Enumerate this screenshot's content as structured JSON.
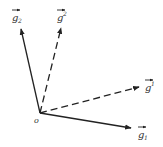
{
  "diagram": {
    "type": "vector-basis",
    "origin": {
      "label": "o",
      "x": 40,
      "y": 113
    },
    "vectors": [
      {
        "name": "g_2",
        "base": "g",
        "sub": "2",
        "sup": "",
        "style": "solid",
        "end": [
          21,
          28
        ],
        "label_pos": [
          14,
          20
        ]
      },
      {
        "name": "g^2",
        "base": "g",
        "sub": "",
        "sup": "2",
        "style": "dashed",
        "end": [
          61,
          27
        ],
        "label_pos": [
          57,
          20
        ]
      },
      {
        "name": "g^1",
        "base": "g",
        "sub": "",
        "sup": "1",
        "style": "dashed",
        "end": [
          140,
          87
        ],
        "label_pos": [
          145,
          91
        ]
      },
      {
        "name": "g_1",
        "base": "g",
        "sub": "1",
        "sup": "",
        "style": "solid",
        "end": [
          132,
          128
        ],
        "label_pos": [
          138,
          138
        ]
      }
    ],
    "colors": {
      "line": "#222222",
      "text": "#333333",
      "background": "#ffffff"
    }
  }
}
